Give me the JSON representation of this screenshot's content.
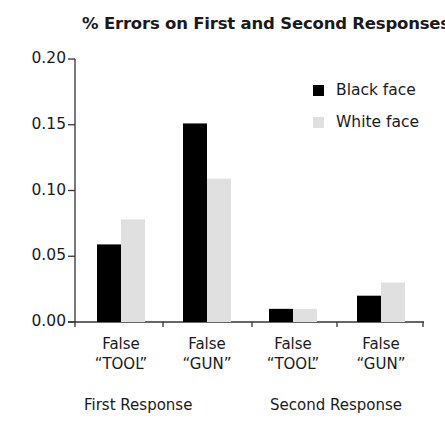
{
  "chart_data": {
    "type": "bar",
    "title": "% Errors on First and Second Responses",
    "xlabel": "",
    "ylabel": "",
    "ylim": [
      0,
      0.2
    ],
    "yticks": [
      "0.00",
      "0.05",
      "0.10",
      "0.15",
      "0.20"
    ],
    "grid": false,
    "legend_position": "upper right",
    "categories": [
      "False “TOOL”",
      "False “GUN”",
      "False “TOOL”",
      "False “GUN”"
    ],
    "category_lines": [
      [
        "False",
        "“TOOL”"
      ],
      [
        "False",
        "“GUN”"
      ],
      [
        "False",
        "“TOOL”"
      ],
      [
        "False",
        "“GUN”"
      ]
    ],
    "groups": [
      {
        "label": "First Response",
        "categories": [
          0,
          1
        ]
      },
      {
        "label": "Second Response",
        "categories": [
          2,
          3
        ]
      }
    ],
    "series": [
      {
        "name": "Black face",
        "color": "#000000",
        "values": [
          0.059,
          0.151,
          0.01,
          0.02
        ]
      },
      {
        "name": "White face",
        "color": "#e0e0e0",
        "values": [
          0.078,
          0.109,
          0.01,
          0.03
        ]
      }
    ]
  }
}
